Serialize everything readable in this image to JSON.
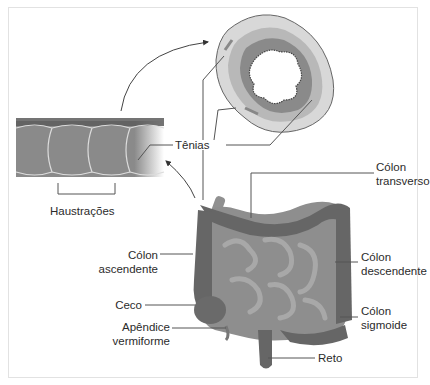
{
  "diagram": {
    "type": "anatomical-illustration",
    "palette": {
      "background": "#ffffff",
      "frame": "#e2e2e2",
      "line": "#555555",
      "text": "#2b2b2b",
      "colon_dark": "#6a6a6a",
      "small_intestine": "#8c8c8c",
      "cross_outer": "#d4d4d4",
      "cross_mid": "#b0b0b0",
      "cross_inner": "#7a7a7a"
    },
    "labels": {
      "tenias": "Tênias",
      "haustracoes": "Haustrações",
      "colon_transverso_1": "Cólon",
      "colon_transverso_2": "transverso",
      "colon_ascendente_1": "Cólon",
      "colon_ascendente_2": "ascendente",
      "colon_descendente_1": "Cólon",
      "colon_descendente_2": "descendente",
      "colon_sigmoide_1": "Cólon",
      "colon_sigmoide_2": "sigmoide",
      "ceco": "Ceco",
      "apendice_1": "Apêndice",
      "apendice_2": "vermiforme",
      "reto": "Reto"
    },
    "panels": [
      {
        "name": "colon-segment-side-view",
        "caption_label": "Haustrações"
      },
      {
        "name": "colon-cross-section",
        "caption_label": "Tênias"
      },
      {
        "name": "digestive-tract-overview"
      }
    ]
  }
}
